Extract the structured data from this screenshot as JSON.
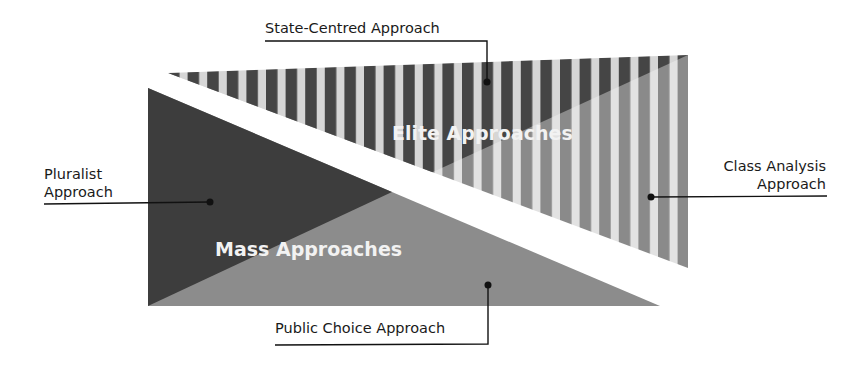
{
  "diagram": {
    "regions": {
      "elite": {
        "label": "Elite Approaches",
        "pattern": "vertical-stripes"
      },
      "mass": {
        "label": "Mass Approaches",
        "pattern": "solid"
      }
    },
    "callouts": {
      "state_centred": {
        "label": "State-Centred Approach"
      },
      "pluralist": {
        "line1": "Pluralist",
        "line2": "Approach"
      },
      "class_analysis": {
        "line1": "Class Analysis",
        "line2": "Approach"
      },
      "public_choice": {
        "label": "Public Choice Approach"
      }
    },
    "colors": {
      "dark": "#3d3d3d",
      "mid": "#8c8c8c",
      "stripe_light": "#d6d6d6",
      "stripe_dark_upper": "#454545",
      "stripe_dark_lower": "#8a8a8a",
      "line": "#111111",
      "region_text": "#f2f2f2"
    }
  }
}
